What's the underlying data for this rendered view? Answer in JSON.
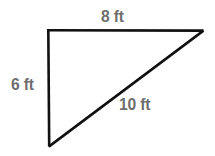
{
  "figure": {
    "kind": "right-triangle-diagram",
    "background_color": "#ffffff",
    "stroke_color": "#111111",
    "stroke_width": 2.6,
    "label_color": "#6e6e6e",
    "vertices": {
      "top_left": [
        48,
        30
      ],
      "top_right": [
        203,
        31
      ],
      "bottom_left": [
        49,
        146
      ]
    },
    "edges": [
      {
        "name": "top-edge",
        "from": "top_left",
        "to": "top_right",
        "label": "8 ft"
      },
      {
        "name": "left-edge",
        "from": "top_left",
        "to": "bottom_left",
        "label": "6 ft"
      },
      {
        "name": "hypotenuse-edge",
        "from": "bottom_left",
        "to": "top_right",
        "label": "10 ft"
      }
    ]
  },
  "labels": {
    "top": "8 ft",
    "left": "6 ft",
    "hypotenuse": "10 ft"
  },
  "units": "ft"
}
